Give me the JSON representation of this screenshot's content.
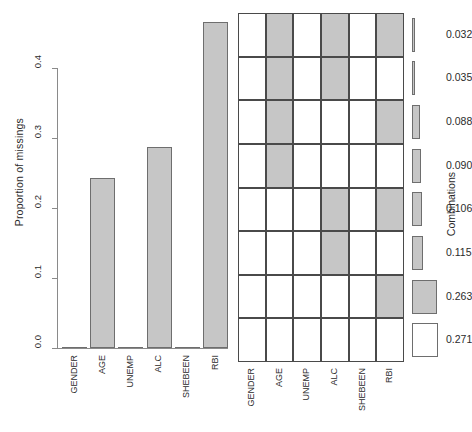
{
  "chart_data": {
    "type": "bar",
    "title": "",
    "panels": [
      {
        "name": "proportion-barplot",
        "type": "bar",
        "ylabel": "Proportion of missings",
        "xlabel": "",
        "ylim": [
          0,
          0.47
        ],
        "yticks": [
          "0.0",
          "0.1",
          "0.2",
          "0.3",
          "0.4"
        ],
        "ytick_values": [
          0.0,
          0.1,
          0.2,
          0.3,
          0.4
        ],
        "categories": [
          "GENDER",
          "AGE",
          "UNEMP",
          "ALC",
          "SHEBEEN",
          "RBI"
        ],
        "values": [
          0.0,
          0.243,
          0.0,
          0.287,
          0.0,
          0.466
        ],
        "grid": false,
        "legend": "none"
      },
      {
        "name": "combinations-matrix",
        "type": "heatmap",
        "ylabel": "Combinations",
        "xlabel": "",
        "columns": [
          "GENDER",
          "AGE",
          "UNEMP",
          "ALC",
          "SHEBEEN",
          "RBI"
        ],
        "row_values": [
          0.032,
          0.035,
          0.088,
          0.09,
          0.106,
          0.115,
          0.263,
          0.271
        ],
        "row_labels": [
          "0.032",
          "0.035",
          "0.088",
          "0.090",
          "0.106",
          "0.115",
          "0.263",
          "0.271"
        ],
        "cells": [
          [
            0,
            1,
            0,
            1,
            0,
            1
          ],
          [
            0,
            1,
            0,
            1,
            0,
            0
          ],
          [
            0,
            1,
            0,
            0,
            0,
            1
          ],
          [
            0,
            1,
            0,
            0,
            0,
            0
          ],
          [
            0,
            0,
            0,
            1,
            0,
            1
          ],
          [
            0,
            0,
            0,
            1,
            0,
            0
          ],
          [
            0,
            0,
            0,
            0,
            0,
            1
          ],
          [
            0,
            0,
            0,
            0,
            0,
            0
          ]
        ],
        "legend": "right"
      }
    ],
    "colors": {
      "missing_fill": "#c6c6c6",
      "observed_fill": "#ffffff",
      "cell_border": "#4a4a4a",
      "bar_border": "#6e6e6e",
      "axis": "#8a8a8a",
      "text": "#2b2b2b"
    }
  },
  "barplot": {
    "ylabel": "Proportion of missings",
    "yticks": [
      "0.0",
      "0.1",
      "0.2",
      "0.3",
      "0.4"
    ],
    "bars": [
      {
        "label": "GENDER",
        "value": 0.0
      },
      {
        "label": "AGE",
        "value": 0.243
      },
      {
        "label": "UNEMP",
        "value": 0.0
      },
      {
        "label": "ALC",
        "value": 0.287
      },
      {
        "label": "SHEBEEN",
        "value": 0.0
      },
      {
        "label": "RBI",
        "value": 0.466
      }
    ]
  },
  "matrix": {
    "ylabel": "Combinations",
    "columns": [
      "GENDER",
      "AGE",
      "UNEMP",
      "ALC",
      "SHEBEEN",
      "RBI"
    ],
    "rows": [
      {
        "value": "0.032",
        "cells": [
          0,
          1,
          0,
          1,
          0,
          1
        ]
      },
      {
        "value": "0.035",
        "cells": [
          0,
          1,
          0,
          1,
          0,
          0
        ]
      },
      {
        "value": "0.088",
        "cells": [
          0,
          1,
          0,
          0,
          0,
          1
        ]
      },
      {
        "value": "0.090",
        "cells": [
          0,
          1,
          0,
          0,
          0,
          0
        ]
      },
      {
        "value": "0.106",
        "cells": [
          0,
          0,
          0,
          1,
          0,
          1
        ]
      },
      {
        "value": "0.115",
        "cells": [
          0,
          0,
          0,
          1,
          0,
          0
        ]
      },
      {
        "value": "0.263",
        "cells": [
          0,
          0,
          0,
          0,
          0,
          1
        ]
      },
      {
        "value": "0.271",
        "cells": [
          0,
          0,
          0,
          0,
          0,
          0
        ]
      }
    ]
  }
}
